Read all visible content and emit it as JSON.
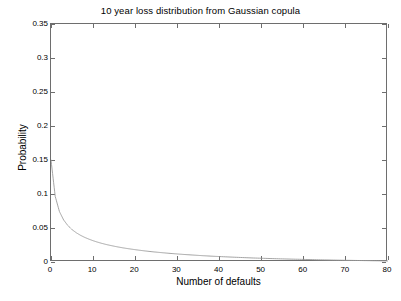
{
  "chart_data": {
    "type": "line",
    "title": "10 year loss distribution from Gaussian copula",
    "xlabel": "Number of defaults",
    "ylabel": "Probability",
    "xlim": [
      0,
      80
    ],
    "ylim": [
      0,
      0.35
    ],
    "grid": false,
    "legend": null,
    "xticks": [
      0,
      10,
      20,
      30,
      40,
      50,
      60,
      70,
      80
    ],
    "xticklabels": [
      "0",
      "10",
      "20",
      "30",
      "40",
      "50",
      "60",
      "70",
      "80"
    ],
    "yticks": [
      0,
      0.05,
      0.1,
      0.15,
      0.2,
      0.25,
      0.3,
      0.35
    ],
    "yticklabels": [
      "0",
      "0.05",
      "0.1",
      "0.15",
      "0.2",
      "0.25",
      "0.3",
      "0.35"
    ],
    "line_color": "#9a9a9a",
    "axis_color": "#6e6e6e",
    "series": [
      {
        "name": "loss distribution",
        "x": [
          0,
          1,
          2,
          3,
          4,
          5,
          6,
          7,
          8,
          9,
          10,
          11,
          12,
          13,
          14,
          15,
          16,
          17,
          18,
          19,
          20,
          22,
          24,
          26,
          28,
          30,
          32,
          34,
          36,
          38,
          40,
          44,
          48,
          52,
          56,
          60,
          64,
          68,
          72,
          76,
          80
        ],
        "y": [
          0.15,
          0.0965,
          0.0742,
          0.0618,
          0.0536,
          0.0476,
          0.043,
          0.0393,
          0.0362,
          0.0336,
          0.0313,
          0.0293,
          0.0275,
          0.0259,
          0.0245,
          0.0232,
          0.022,
          0.0209,
          0.0199,
          0.019,
          0.0181,
          0.0165,
          0.0151,
          0.0139,
          0.0128,
          0.0118,
          0.0109,
          0.0101,
          0.0093,
          0.0086,
          0.008,
          0.0069,
          0.0059,
          0.0051,
          0.0044,
          0.0038,
          0.0032,
          0.0027,
          0.0023,
          0.0019,
          0.0015
        ]
      }
    ]
  }
}
